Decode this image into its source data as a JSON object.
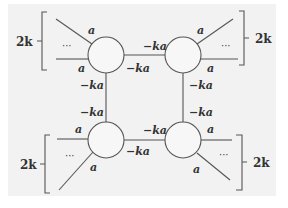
{
  "diagram": {
    "background": "#f2f2f2",
    "nodes": [
      {
        "id": "top-left",
        "cx": 106,
        "cy": 55
      },
      {
        "id": "top-right",
        "cx": 183,
        "cy": 55
      },
      {
        "id": "bottom-left",
        "cx": 106,
        "cy": 140
      },
      {
        "id": "bottom-right",
        "cx": 183,
        "cy": 140
      }
    ],
    "labels": {
      "tl_ext_upper": "a",
      "tl_ext_lower": "a",
      "tl_dots": "···",
      "tl_right": "−ka",
      "tl_down": "−ka",
      "tr_ext_upper": "a",
      "tr_ext_lower": "a",
      "tr_dots": "···",
      "tr_left": "−ka",
      "tr_down": "−ka",
      "bl_ext_upper": "a",
      "bl_ext_lower": "a",
      "bl_dots": "···",
      "bl_up": "−ka",
      "bl_right": "−ka",
      "br_ext_upper": "a",
      "br_ext_lower": "a",
      "br_dots": "···",
      "br_up": "−ka",
      "br_left": "−ka"
    },
    "brackets": {
      "top_left": "2k",
      "top_right": "2k",
      "bottom_left": "2k",
      "bottom_right": "2k"
    }
  }
}
